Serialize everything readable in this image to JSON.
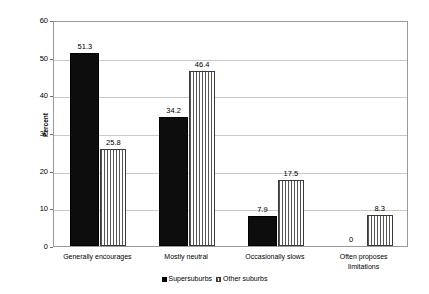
{
  "chart_data": {
    "type": "bar",
    "title": "",
    "xlabel": "",
    "ylabel": "Percent",
    "ylim": [
      0,
      60
    ],
    "yticks": [
      "0",
      "10",
      "20",
      "30",
      "40",
      "50",
      "60"
    ],
    "grid": true,
    "legend_position": "bottom-center",
    "categories": [
      "Generally encourages",
      "Mostly neutral",
      "Occasionally slows",
      "Often proposes limitations"
    ],
    "category_lines": [
      [
        "Generally encourages"
      ],
      [
        "Mostly neutral"
      ],
      [
        "Occasionally slows"
      ],
      [
        "Often proposes",
        "limitations"
      ]
    ],
    "series": [
      {
        "name": "Supersuburbs",
        "style": "solid-black",
        "values": [
          51.3,
          34.2,
          7.9,
          0
        ],
        "labels": [
          "51.3",
          "34.2",
          "7.9",
          "0"
        ]
      },
      {
        "name": "Other suburbs",
        "style": "vertical-stripes",
        "values": [
          25.8,
          46.4,
          17.5,
          8.3
        ],
        "labels": [
          "25.8",
          "46.4",
          "17.5",
          "8.3"
        ]
      }
    ]
  },
  "colors": {
    "series_a": "#0d0d0d",
    "series_b_stripe": "#555555",
    "plot_border": "#9a9a9a",
    "gridline": "#c9c9c9",
    "background": "#ffffff",
    "text": "#000000"
  }
}
